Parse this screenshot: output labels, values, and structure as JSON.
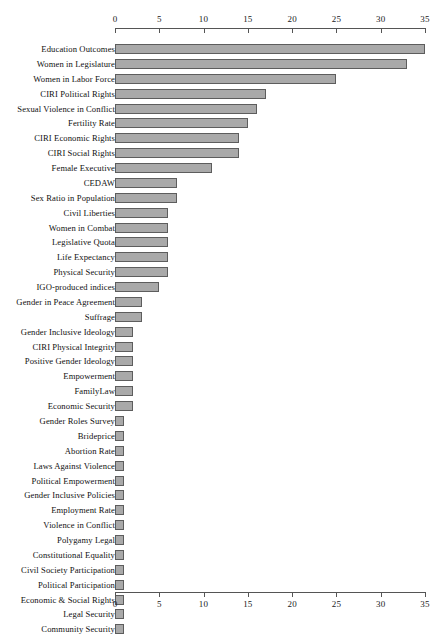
{
  "chart_data": {
    "type": "bar",
    "orientation": "horizontal",
    "title": "",
    "subtitle": "",
    "xlabel": "",
    "ylabel": "",
    "xlim": [
      0,
      35
    ],
    "ylim": null,
    "grid": false,
    "legend": null,
    "legend_position": "none",
    "axis_top": true,
    "axis_bottom": true,
    "tick_labels": [
      "0",
      "5",
      "10",
      "15",
      "20",
      "25",
      "30",
      "35"
    ],
    "tick_values": [
      0,
      5,
      10,
      15,
      20,
      25,
      30,
      35
    ],
    "bar_fill_color": "#a9a9a9",
    "bar_border_color": "#5d5d5d",
    "axis_color": "#555555",
    "categories": [
      "Education Outcomes",
      "Women in Legislature",
      "Women in Labor Force",
      "CIRI Political Rights",
      "Sexual Violence in Conflict",
      "Fertility Rate",
      "CIRI Economic Rights",
      "CIRI Social Rights",
      "Female Executive",
      "CEDAW",
      "Sex Ratio in Population",
      "Civil Liberties",
      "Women in Combat",
      "Legislative Quota",
      "Life Expectancy",
      "Physical Security",
      "IGO-produced indices",
      "Gender in Peace Agreement",
      "Suffrage",
      "Gender Inclusive Ideology",
      "CIRI Physical Integrity",
      "Positive Gender Ideology",
      "Empowerment",
      "FamilyLaw",
      "Economic Security",
      "Gender Roles Survey",
      "Brideprice",
      "Abortion Rate",
      "Laws Against Violence",
      "Political Empowerment",
      "Gender Inclusive Policies",
      "Employment Rate",
      "Violence in Conflict",
      "Polygamy Legal",
      "Constitutional Equality",
      "Civil Society Participation",
      "Political Participation",
      "Economic & Social Rights",
      "Legal Security",
      "Community Security"
    ],
    "values": [
      35,
      33,
      25,
      17,
      16,
      15,
      14,
      14,
      11,
      7,
      7,
      6,
      6,
      6,
      6,
      6,
      5,
      3,
      3,
      2,
      2,
      2,
      2,
      2,
      2,
      1,
      1,
      1,
      1,
      1,
      1,
      1,
      1,
      1,
      1,
      1,
      1,
      1,
      1,
      1
    ]
  }
}
